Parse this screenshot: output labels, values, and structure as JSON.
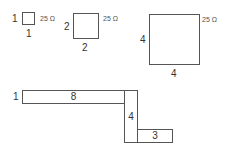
{
  "figure": {
    "squares": [
      {
        "id": "square-1",
        "side_label": "1",
        "bottom_label": "1",
        "resistance": "25 Ω"
      },
      {
        "id": "square-2",
        "side_label": "2",
        "bottom_label": "2",
        "resistance": "25 Ω"
      },
      {
        "id": "square-4",
        "side_label": "4",
        "bottom_label": "4",
        "resistance": "25 Ω"
      }
    ],
    "strip": {
      "width_label": "1",
      "segments": [
        {
          "id": "segment-horizontal-top",
          "length_label": "8"
        },
        {
          "id": "segment-vertical",
          "length_label": "4"
        },
        {
          "id": "segment-horizontal-bottom",
          "length_label": "3"
        }
      ]
    }
  },
  "colors": {
    "stroke": "#555555",
    "text": "#333333",
    "background": "#ffffff"
  }
}
